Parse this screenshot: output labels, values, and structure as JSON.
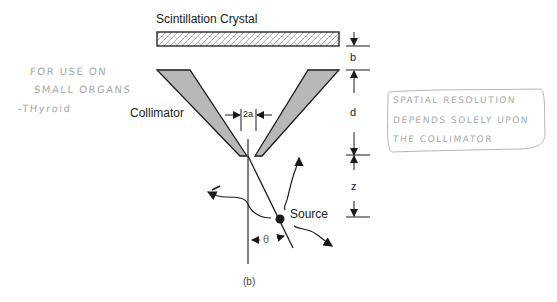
{
  "diagram": {
    "title_label": "Scintillation   Crystal",
    "collimator_label": "Collimator",
    "source_label": "Source",
    "caption": "(b)",
    "dimensions": {
      "b": "b",
      "d": "d",
      "z": "z",
      "aperture": "2a",
      "angle": "θ"
    }
  },
  "annotations": {
    "left_note": [
      "FOR USE ON",
      "SMALL ORGANS",
      "-THyroid"
    ],
    "right_note": [
      "SPATIAL RESOLUTION",
      "DEPENDS SOLELY UPON",
      "THE COLLIMATOR"
    ]
  },
  "colors": {
    "line": "#1a1a1a",
    "collimator_fill": "#b8b8b8",
    "crystal_pattern": "#9a9a9a",
    "handwriting": "#a8a8a8"
  }
}
